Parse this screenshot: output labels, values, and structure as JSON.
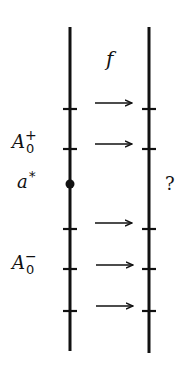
{
  "diagram": {
    "map_label": "f",
    "left_labels": {
      "upper_set": {
        "base": "A",
        "sub": "0",
        "sup": "+"
      },
      "point": {
        "base": "a",
        "sup": "*"
      },
      "lower_set": {
        "base": "A",
        "sub": "0",
        "sup": "−"
      }
    },
    "right_label": "?",
    "left_axis": {
      "x": 70,
      "y_top": 27,
      "y_bottom": 351
    },
    "right_axis": {
      "x": 149,
      "y_top": 27,
      "y_bottom": 353
    },
    "tick_positions_y": [
      109,
      149,
      229,
      269,
      311
    ],
    "arrow_positions_y": [
      103,
      144,
      223,
      265,
      306
    ],
    "marked_point_y": 184,
    "colors": {
      "ink": "#111111",
      "background": "#ffffff"
    }
  }
}
